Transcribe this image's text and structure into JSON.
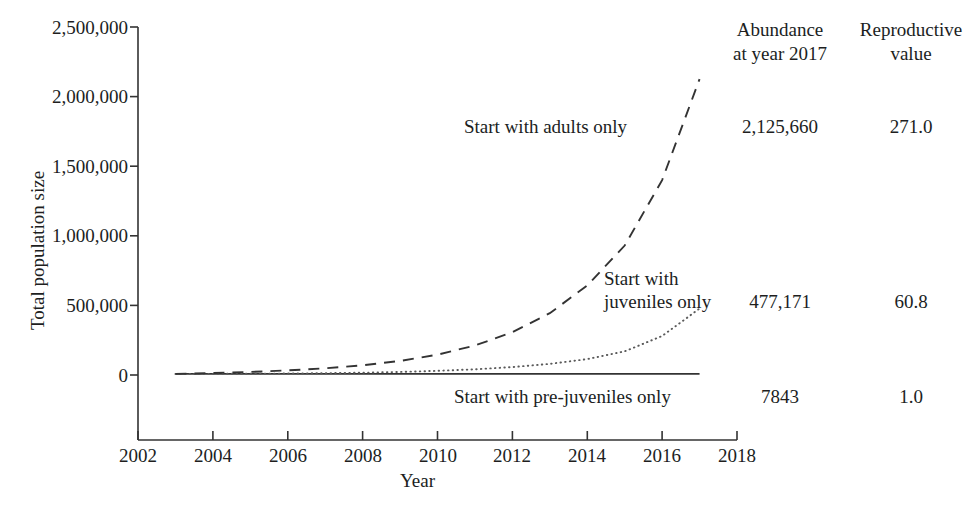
{
  "chart_data": {
    "type": "line",
    "title": "",
    "xlabel": "Year",
    "ylabel": "Total population size",
    "xlim": [
      2002,
      2018
    ],
    "ylim": [
      0,
      2500000
    ],
    "grid": false,
    "legend_position": "inline-annotations",
    "x_ticks": [
      "2002",
      "2004",
      "2006",
      "2008",
      "2010",
      "2012",
      "2014",
      "2016",
      "2018"
    ],
    "x_tick_values": [
      2002,
      2004,
      2006,
      2008,
      2010,
      2012,
      2014,
      2016,
      2018
    ],
    "y_ticks": [
      "0",
      "500,000",
      "1,000,000",
      "1,500,000",
      "2,000,000",
      "2,500,000"
    ],
    "y_tick_values": [
      0,
      500000,
      1000000,
      1500000,
      2000000,
      2500000
    ],
    "x": [
      2003,
      2004,
      2005,
      2006,
      2007,
      2008,
      2009,
      2010,
      2011,
      2012,
      2013,
      2014,
      2015,
      2016,
      2017
    ],
    "series": [
      {
        "name": "Start with adults only",
        "style": "dashed",
        "color": "#333333",
        "values": [
          7843,
          14500,
          22000,
          33000,
          48000,
          70000,
          101000,
          146000,
          212000,
          307000,
          444000,
          643000,
          930000,
          1400000,
          2125660
        ]
      },
      {
        "name": "Start with juveniles only",
        "style": "dotted",
        "color": "#5a5a5a",
        "values": [
          7843,
          8200,
          9000,
          10500,
          13000,
          16500,
          22000,
          30000,
          41000,
          57000,
          80000,
          114000,
          170000,
          280000,
          477171
        ]
      },
      {
        "name": "Start with pre-juveniles only",
        "style": "solid",
        "color": "#333333",
        "values": [
          7843,
          7843,
          7843,
          7843,
          7843,
          7843,
          7843,
          7843,
          7843,
          7843,
          7843,
          7843,
          7843,
          7843,
          7843
        ]
      }
    ]
  },
  "axis": {
    "ylabel": "Total population size",
    "xlabel": "Year",
    "y_ticks": [
      "2,500,000",
      "2,000,000",
      "1,500,000",
      "1,000,000",
      "500,000",
      "0"
    ],
    "x_ticks": [
      "2002",
      "2004",
      "2006",
      "2008",
      "2010",
      "2012",
      "2014",
      "2016",
      "2018"
    ]
  },
  "annotations": {
    "adults": "Start with adults only",
    "juveniles_line1": "Start with",
    "juveniles_line2": "juveniles only",
    "prejuveniles": "Start with pre-juveniles only"
  },
  "table": {
    "headers": [
      {
        "line1": "Abundance",
        "line2": "at year 2017"
      },
      {
        "line1": "Reproductive",
        "line2": "value"
      }
    ],
    "rows": [
      {
        "abundance": "2,125,660",
        "reproductive_value": "271.0"
      },
      {
        "abundance": "477,171",
        "reproductive_value": "60.8"
      },
      {
        "abundance": "7843",
        "reproductive_value": "1.0"
      }
    ]
  },
  "colors": {
    "axis": "#333333",
    "text": "#201e1e",
    "adults_curve": "#333333",
    "juveniles_curve": "#5a5a5a",
    "prejuveniles_curve": "#333333"
  }
}
